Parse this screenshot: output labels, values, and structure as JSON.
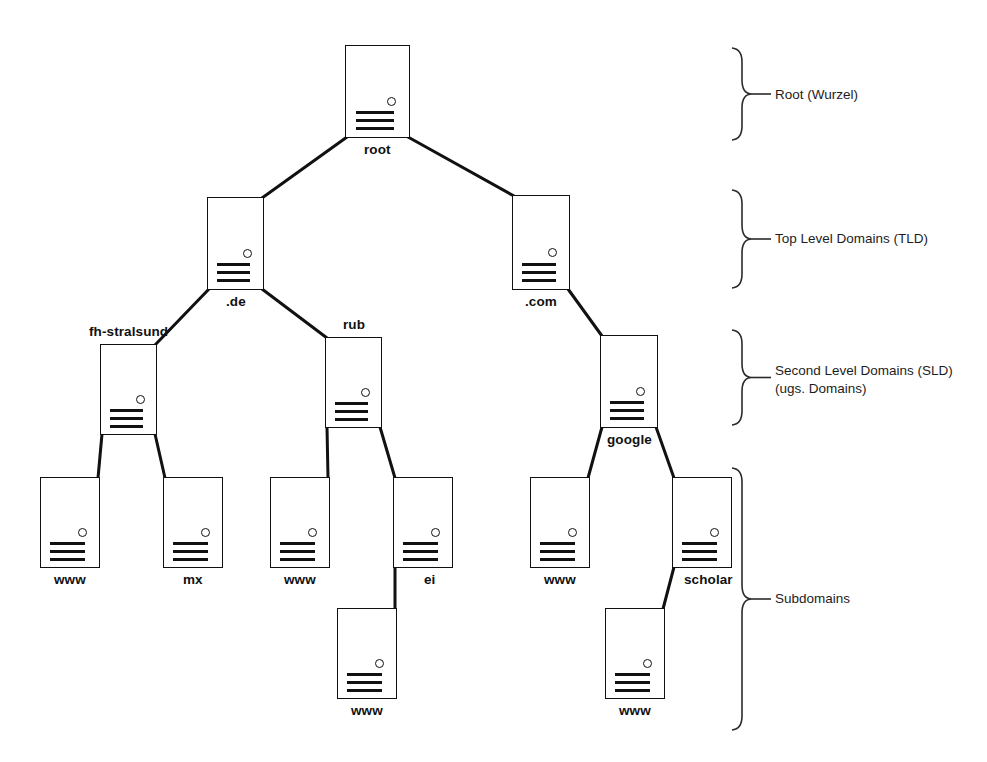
{
  "diagram": {
    "background_color": "#ffffff",
    "line_color": "#111111",
    "text_color": "#1a1a1a"
  },
  "nodes": [
    {
      "id": "root",
      "label": "root",
      "x": 345,
      "y": 45,
      "w": 65,
      "h": 93,
      "label_pos": "below"
    },
    {
      "id": "de",
      "label": ".de",
      "x": 207,
      "y": 197,
      "w": 57,
      "h": 93,
      "label_pos": "below"
    },
    {
      "id": "com",
      "label": ".com",
      "x": 512,
      "y": 195,
      "w": 58,
      "h": 95,
      "label_pos": "below"
    },
    {
      "id": "fh-stralsund",
      "label": "fh-stralsund",
      "x": 100,
      "y": 344,
      "w": 57,
      "h": 91,
      "label_pos": "above"
    },
    {
      "id": "rub",
      "label": "rub",
      "x": 325,
      "y": 337,
      "w": 57,
      "h": 91,
      "label_pos": "above"
    },
    {
      "id": "google",
      "label": "google",
      "x": 600,
      "y": 335,
      "w": 58,
      "h": 93,
      "label_pos": "below"
    },
    {
      "id": "www-fhs",
      "label": "www",
      "x": 40,
      "y": 477,
      "w": 60,
      "h": 91,
      "label_pos": "below"
    },
    {
      "id": "mx-fhs",
      "label": "mx",
      "x": 163,
      "y": 477,
      "w": 60,
      "h": 91,
      "label_pos": "below"
    },
    {
      "id": "www-rub",
      "label": "www",
      "x": 270,
      "y": 477,
      "w": 60,
      "h": 91,
      "label_pos": "below"
    },
    {
      "id": "ei-rub",
      "label": "ei",
      "x": 393,
      "y": 477,
      "w": 60,
      "h": 91,
      "label_pos": "below-right"
    },
    {
      "id": "www-google",
      "label": "www",
      "x": 530,
      "y": 477,
      "w": 60,
      "h": 91,
      "label_pos": "below"
    },
    {
      "id": "scholar-google",
      "label": "scholar",
      "x": 672,
      "y": 477,
      "w": 60,
      "h": 91,
      "label_pos": "below-right"
    },
    {
      "id": "www-ei",
      "label": "www",
      "x": 337,
      "y": 608,
      "w": 60,
      "h": 91,
      "label_pos": "below"
    },
    {
      "id": "www-scholar",
      "label": "www",
      "x": 605,
      "y": 608,
      "w": 60,
      "h": 91,
      "label_pos": "below"
    }
  ],
  "edges": [
    {
      "from": "root",
      "to": "de",
      "from_side": "bottom-left",
      "to_side": "top-right"
    },
    {
      "from": "root",
      "to": "com",
      "from_side": "bottom-right",
      "to_side": "top-left"
    },
    {
      "from": "de",
      "to": "fh-stralsund",
      "from_side": "bottom-left",
      "to_side": "top-right"
    },
    {
      "from": "de",
      "to": "rub",
      "from_side": "bottom-right",
      "to_side": "top-left"
    },
    {
      "from": "com",
      "to": "google",
      "from_side": "bottom-right",
      "to_side": "top-left"
    },
    {
      "from": "fh-stralsund",
      "to": "www-fhs",
      "from_side": "bottom-left",
      "to_side": "top-right"
    },
    {
      "from": "fh-stralsund",
      "to": "mx-fhs",
      "from_side": "bottom-right",
      "to_side": "top-left"
    },
    {
      "from": "rub",
      "to": "www-rub",
      "from_side": "bottom-left",
      "to_side": "top-right"
    },
    {
      "from": "rub",
      "to": "ei-rub",
      "from_side": "bottom-right",
      "to_side": "top-left"
    },
    {
      "from": "google",
      "to": "www-google",
      "from_side": "bottom-left",
      "to_side": "top-right"
    },
    {
      "from": "google",
      "to": "scholar-google",
      "from_side": "bottom-right",
      "to_side": "top-left"
    },
    {
      "from": "ei-rub",
      "to": "www-ei",
      "from_side": "bottom-left",
      "to_side": "top-right"
    },
    {
      "from": "scholar-google",
      "to": "www-scholar",
      "from_side": "bottom-left",
      "to_side": "top-right"
    }
  ],
  "level_annotations": [
    {
      "id": "root-level",
      "lines": [
        "Root (Wurzel)"
      ],
      "brace_x": 742,
      "brace_top": 48,
      "brace_bottom": 140,
      "label_x": 775,
      "label_y": 86
    },
    {
      "id": "tld-level",
      "lines": [
        "Top Level Domains (TLD)"
      ],
      "brace_x": 742,
      "brace_top": 190,
      "brace_bottom": 288,
      "label_x": 775,
      "label_y": 230
    },
    {
      "id": "sld-level",
      "lines": [
        "Second Level Domains (SLD)",
        "(ugs. Domains)"
      ],
      "brace_x": 742,
      "brace_top": 330,
      "brace_bottom": 425,
      "label_x": 775,
      "label_y": 362
    },
    {
      "id": "subdomain-level",
      "lines": [
        "Subdomains"
      ],
      "brace_x": 742,
      "brace_top": 468,
      "brace_bottom": 730,
      "label_x": 775,
      "label_y": 590
    }
  ]
}
